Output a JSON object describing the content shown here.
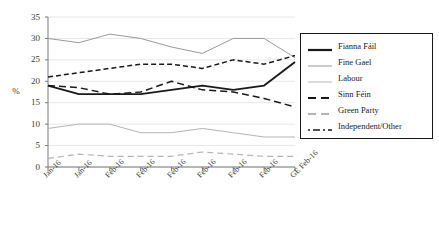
{
  "axes": {
    "ylabel": "%",
    "yticks": [
      "0",
      "5",
      "10",
      "15",
      "20",
      "25",
      "30",
      "35"
    ],
    "xticks": [
      "Jan-16",
      "Jan-16",
      "Feb-16",
      "Feb-16",
      "Feb-16",
      "Feb-16",
      "Feb-16",
      "Feb-16",
      "GE Feb-16"
    ]
  },
  "legend": {
    "items": [
      {
        "label": "Fianna Fáil",
        "style": "solid-thick",
        "color": "#1a1a1a"
      },
      {
        "label": "Fine Gael",
        "style": "solid-thin",
        "color": "#9a9a9a"
      },
      {
        "label": "Labour",
        "style": "solid-thin",
        "color": "#b5b5b5"
      },
      {
        "label": "Sinn Féin",
        "style": "dashed",
        "color": "#1a1a1a"
      },
      {
        "label": "Green Party",
        "style": "dashed",
        "color": "#b5b5b5"
      },
      {
        "label": "Independent/Other",
        "style": "dash-dot",
        "color": "#1a1a1a"
      }
    ]
  },
  "chart_data": {
    "type": "line",
    "title": "",
    "xlabel": "",
    "ylabel": "%",
    "ylim": [
      0,
      35
    ],
    "ytick_step": 5,
    "grid": "horizontal",
    "legend_position": "right",
    "categories": [
      "Jan-16",
      "Jan-16",
      "Feb-16",
      "Feb-16",
      "Feb-16",
      "Feb-16",
      "Feb-16",
      "Feb-16",
      "GE Feb-16"
    ],
    "series": [
      {
        "name": "Fianna Fáil",
        "values": [
          19,
          17,
          17,
          17,
          18,
          19,
          18,
          19,
          24.5
        ]
      },
      {
        "name": "Fine Gael",
        "values": [
          30,
          29,
          31,
          30,
          28,
          26.5,
          30,
          30,
          25.5
        ]
      },
      {
        "name": "Labour",
        "values": [
          9,
          10,
          10,
          8,
          8,
          9,
          8,
          7,
          7
        ]
      },
      {
        "name": "Sinn Féin",
        "values": [
          19,
          18.5,
          17,
          17.5,
          20,
          18,
          17.5,
          16,
          14
        ]
      },
      {
        "name": "Green Party",
        "values": [
          2,
          3,
          2.5,
          2.5,
          2.5,
          3.5,
          3,
          2.5,
          2.5
        ]
      },
      {
        "name": "Independent/Other",
        "values": [
          21,
          22,
          23,
          24,
          24,
          23,
          25,
          24,
          26
        ]
      }
    ]
  }
}
